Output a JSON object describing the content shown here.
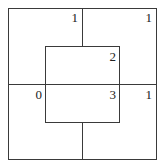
{
  "diagram": {
    "outer_square_labels": {
      "top_left_quadrant": "1",
      "top_right_quadrant": "1",
      "bottom_left_quadrant": "0",
      "bottom_right_quadrant": "1"
    },
    "inner_square_labels": {
      "top_half": "2",
      "bottom_half": "3"
    },
    "line_color": "#3a3a3a",
    "text_color": "#222222"
  }
}
